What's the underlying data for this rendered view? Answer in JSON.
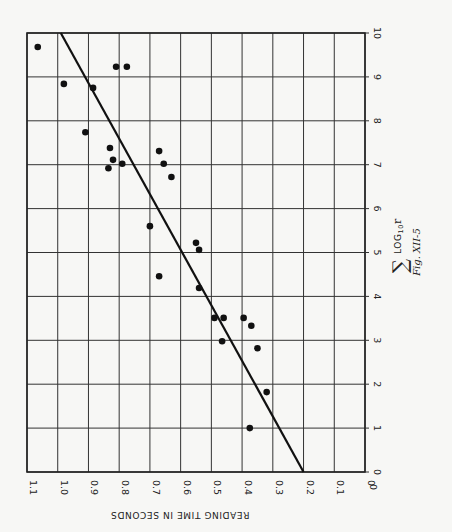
{
  "chart_data": {
    "type": "scatter",
    "title": "",
    "caption": "Fig. XII-5",
    "orientation": "rotated 90° clockwise (x-axis runs vertically on right side, y-axis runs horizontally along bottom, reversed)",
    "xlabel": "Σ LOG10 r",
    "ylabel": "READING TIME IN SECONDS",
    "xlim": [
      0,
      10
    ],
    "ylim": [
      0,
      1.1
    ],
    "x_ticks": [
      "0",
      "1",
      "2",
      "3",
      "4",
      "5",
      "6",
      "7",
      "8",
      "9",
      "10"
    ],
    "y_ticks": [
      "0",
      "0.1",
      "0.2",
      "0.3",
      "0.4",
      "0.5",
      "0.6",
      "0.7",
      "0.8",
      "0.9",
      "1.0",
      "1.1"
    ],
    "grid": true,
    "legend": null,
    "series": [
      {
        "name": "observations",
        "marker": "filled-circle",
        "points": [
          {
            "x": 9.68,
            "y": 1.065
          },
          {
            "x": 8.84,
            "y": 0.98
          },
          {
            "x": 8.75,
            "y": 0.885
          },
          {
            "x": 9.23,
            "y": 0.81
          },
          {
            "x": 9.23,
            "y": 0.775
          },
          {
            "x": 7.74,
            "y": 0.91
          },
          {
            "x": 7.38,
            "y": 0.83
          },
          {
            "x": 7.11,
            "y": 0.82
          },
          {
            "x": 6.92,
            "y": 0.835
          },
          {
            "x": 7.02,
            "y": 0.79
          },
          {
            "x": 7.31,
            "y": 0.67
          },
          {
            "x": 7.02,
            "y": 0.655
          },
          {
            "x": 6.72,
            "y": 0.63
          },
          {
            "x": 5.6,
            "y": 0.7
          },
          {
            "x": 4.46,
            "y": 0.67
          },
          {
            "x": 5.22,
            "y": 0.55
          },
          {
            "x": 5.06,
            "y": 0.54
          },
          {
            "x": 4.19,
            "y": 0.54
          },
          {
            "x": 3.51,
            "y": 0.49
          },
          {
            "x": 3.51,
            "y": 0.46
          },
          {
            "x": 3.51,
            "y": 0.395
          },
          {
            "x": 3.33,
            "y": 0.37
          },
          {
            "x": 2.98,
            "y": 0.465
          },
          {
            "x": 2.82,
            "y": 0.35
          },
          {
            "x": 1.82,
            "y": 0.32
          },
          {
            "x": 1.0,
            "y": 0.375
          }
        ]
      },
      {
        "name": "fit-line",
        "type": "line",
        "points": [
          {
            "x": 0,
            "y": 0.2
          },
          {
            "x": 10,
            "y": 0.99
          }
        ]
      }
    ]
  },
  "labels": {
    "x_axis_title": "LOG",
    "x_axis_subscript": "10",
    "x_axis_var": "r",
    "sigma": "∑",
    "y_axis_title": "READING TIME IN SECONDS",
    "caption": "Fig. XII-5",
    "corner_zero": "0"
  }
}
